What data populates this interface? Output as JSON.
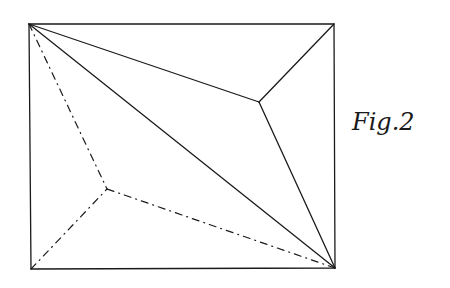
{
  "figure": {
    "label": "Fig.2",
    "stroke_color": "#1a1a1a",
    "background": "#ffffff",
    "rectangle": {
      "top_left": [
        29,
        24
      ],
      "top_right": [
        334,
        24
      ],
      "bottom_right": [
        335,
        268
      ],
      "bottom_left": [
        31,
        269
      ]
    },
    "points": {
      "upper_inner": [
        259,
        102
      ],
      "lower_inner": [
        107,
        189
      ]
    },
    "solid_lines": [
      {
        "name": "diagonal",
        "from": "top_left",
        "to": "bottom_right"
      },
      {
        "name": "top-left-to-upper-inner",
        "from": "top_left",
        "to": "upper_inner"
      },
      {
        "name": "top-right-to-upper-inner",
        "from": "top_right",
        "to": "upper_inner"
      },
      {
        "name": "bottom-right-to-upper-inner",
        "from": "bottom_right",
        "to": "upper_inner"
      }
    ],
    "dashed_lines": [
      {
        "name": "top-left-to-lower-inner",
        "from": "top_left",
        "to": "lower_inner"
      },
      {
        "name": "bottom-left-to-lower-inner",
        "from": "bottom_left",
        "to": "lower_inner"
      },
      {
        "name": "bottom-right-to-lower-inner",
        "from": "bottom_right",
        "to": "lower_inner"
      }
    ]
  }
}
